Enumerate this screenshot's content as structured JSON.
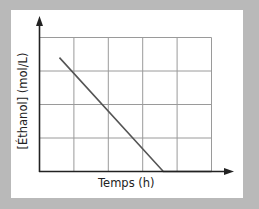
{
  "chart_data": {
    "type": "line",
    "title": "",
    "xlabel": "Temps (h)",
    "ylabel": "[Éthanol] (mol/L)",
    "grid": true,
    "grid_divisions": {
      "x": 5,
      "y": 4
    },
    "xlim": [
      0,
      5
    ],
    "ylim": [
      0,
      4
    ],
    "tick_labels": {
      "x": [],
      "y": []
    },
    "legend": null,
    "series": [
      {
        "name": "[Éthanol]",
        "points": [
          [
            0.58,
            3.4
          ],
          [
            3.6,
            0
          ],
          [
            5,
            0
          ]
        ],
        "color": "#555555"
      }
    ]
  },
  "colors": {
    "background": "#b9b9b9",
    "panel": "#ffffff",
    "axis": "#222222",
    "grid": "#9a9a9a",
    "line": "#555555"
  }
}
